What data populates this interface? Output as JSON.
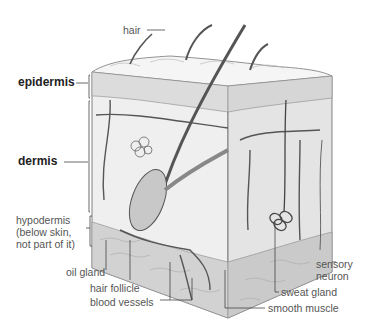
{
  "diagram": {
    "labels": {
      "hair": "hair",
      "epidermis": "epidermis",
      "dermis": "dermis",
      "hypodermis": "hypodermis\n(below skin,\nnot part of it)",
      "oil_gland": "oil gland",
      "hair_follicle": "hair follicle",
      "blood_vessels": "blood vessels",
      "sensory_neuron": "sensory\nneuron",
      "sweat_gland": "sweat gland",
      "smooth_muscle": "smooth muscle"
    },
    "colors": {
      "line": "#444444",
      "skin_top": "#e8e8e8",
      "dermis": "#f2f2f2",
      "hypodermis": "#d8d8d8",
      "shade": "#bdbdbd"
    }
  }
}
